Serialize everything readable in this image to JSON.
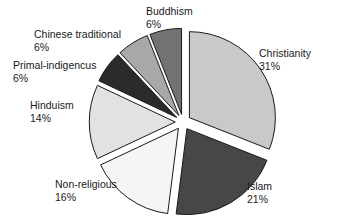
{
  "chart_data": {
    "type": "pie",
    "title": "",
    "subtitle": "",
    "xlabel": "",
    "ylabel": "",
    "legend_position": "none",
    "grid": false,
    "exploded": true,
    "value_unit": "%",
    "categories": [
      "Christianity",
      "Islam",
      "Non-religious",
      "Hinduism",
      "Primal-indigencus",
      "Chinese traditional",
      "Buddhism"
    ],
    "values": [
      31,
      21,
      16,
      14,
      6,
      6,
      6
    ],
    "slices": [
      {
        "label": "Christianity",
        "value": 31,
        "value_text": "31%",
        "color": "#c9c9c9",
        "start_angle": -90,
        "end_angle": 21.6,
        "explode": 0.09
      },
      {
        "label": "Islam",
        "value": 21,
        "value_text": "21%",
        "color": "#474747",
        "start_angle": 21.6,
        "end_angle": 97.2,
        "explode": 0.09
      },
      {
        "label": "Non-religious",
        "value": 16,
        "value_text": "16%",
        "color": "#f5f5f5",
        "start_angle": 97.2,
        "end_angle": 154.8,
        "explode": 0.09
      },
      {
        "label": "Hinduism",
        "value": 14,
        "value_text": "14%",
        "color": "#e2e2e2",
        "start_angle": 154.8,
        "end_angle": 205.2,
        "explode": 0.09
      },
      {
        "label": "Primal-indigencus",
        "value": 6,
        "value_text": "6%",
        "color": "#2b2b2b",
        "start_angle": 205.2,
        "end_angle": 226.8,
        "explode": 0.09
      },
      {
        "label": "Chinese traditional",
        "value": 6,
        "value_text": "6%",
        "color": "#a8a8a8",
        "start_angle": 226.8,
        "end_angle": 248.4,
        "explode": 0.09
      },
      {
        "label": "Buddhism",
        "value": 6,
        "value_text": "6%",
        "color": "#727272",
        "start_angle": 248.4,
        "end_angle": 270,
        "explode": 0.09
      }
    ],
    "style": {
      "background": "#ffffff",
      "outline_color": "#1a1a1a",
      "outline_width": 1,
      "text_color": "#1a1a1a"
    }
  },
  "labels": {
    "christianity": {
      "name": "Christianity",
      "value": "31%"
    },
    "islam": {
      "name": "Islam",
      "value": "21%"
    },
    "non_religious": {
      "name": "Non-religious",
      "value": "16%"
    },
    "hinduism": {
      "name": "Hinduism",
      "value": "14%"
    },
    "primal": {
      "name": "Primal-indigencus",
      "value": "6%"
    },
    "chinese": {
      "name": "Chinese traditional",
      "value": "6%"
    },
    "buddhism": {
      "name": "Buddhism",
      "value": "6%"
    }
  }
}
